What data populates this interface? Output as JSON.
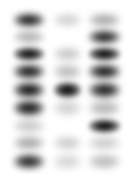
{
  "figure": {
    "background_color": "#ffffff",
    "band_color": "#000000",
    "width": 132,
    "height": 174,
    "lane_count": 3,
    "row_count": 9
  },
  "lanes": [
    {
      "name": "lane-1",
      "x": 14,
      "width": 30
    },
    {
      "name": "lane-2",
      "x": 54,
      "width": 27
    },
    {
      "name": "lane-3",
      "x": 89,
      "width": 31
    }
  ],
  "rows": [
    {
      "name": "row-1",
      "y": 13,
      "height": 14
    },
    {
      "name": "row-2",
      "y": 30,
      "height": 14
    },
    {
      "name": "row-3",
      "y": 47,
      "height": 14
    },
    {
      "name": "row-4",
      "y": 64,
      "height": 15
    },
    {
      "name": "row-5",
      "y": 82,
      "height": 16
    },
    {
      "name": "row-6",
      "y": 100,
      "height": 16
    },
    {
      "name": "row-7",
      "y": 119,
      "height": 14
    },
    {
      "name": "row-8",
      "y": 136,
      "height": 14
    },
    {
      "name": "row-9",
      "y": 154,
      "height": 15
    }
  ],
  "bands": [
    {
      "lane": 0,
      "row": 0,
      "intensity": 0.92,
      "blur": 3.0
    },
    {
      "lane": 0,
      "row": 1,
      "intensity": 0.3,
      "blur": 3.4
    },
    {
      "lane": 0,
      "row": 2,
      "intensity": 0.95,
      "blur": 2.8
    },
    {
      "lane": 0,
      "row": 3,
      "intensity": 0.93,
      "blur": 3.0
    },
    {
      "lane": 0,
      "row": 4,
      "intensity": 0.96,
      "blur": 3.0
    },
    {
      "lane": 0,
      "row": 5,
      "intensity": 0.94,
      "blur": 3.2
    },
    {
      "lane": 0,
      "row": 6,
      "intensity": 0.22,
      "blur": 3.6
    },
    {
      "lane": 0,
      "row": 7,
      "intensity": 0.34,
      "blur": 3.4
    },
    {
      "lane": 0,
      "row": 8,
      "intensity": 0.88,
      "blur": 3.0
    },
    {
      "lane": 1,
      "row": 0,
      "intensity": 0.17,
      "blur": 3.4
    },
    {
      "lane": 1,
      "row": 1,
      "intensity": 0.03,
      "blur": 3.6
    },
    {
      "lane": 1,
      "row": 2,
      "intensity": 0.21,
      "blur": 3.4
    },
    {
      "lane": 1,
      "row": 3,
      "intensity": 0.26,
      "blur": 3.2
    },
    {
      "lane": 1,
      "row": 4,
      "intensity": 0.97,
      "blur": 2.8
    },
    {
      "lane": 1,
      "row": 5,
      "intensity": 0.18,
      "blur": 3.6
    },
    {
      "lane": 1,
      "row": 6,
      "intensity": 0.04,
      "blur": 3.8
    },
    {
      "lane": 1,
      "row": 7,
      "intensity": 0.19,
      "blur": 3.4
    },
    {
      "lane": 1,
      "row": 8,
      "intensity": 0.16,
      "blur": 3.6
    },
    {
      "lane": 2,
      "row": 0,
      "intensity": 0.33,
      "blur": 3.2
    },
    {
      "lane": 2,
      "row": 1,
      "intensity": 0.9,
      "blur": 3.0
    },
    {
      "lane": 2,
      "row": 2,
      "intensity": 0.96,
      "blur": 2.8
    },
    {
      "lane": 2,
      "row": 3,
      "intensity": 0.93,
      "blur": 3.0
    },
    {
      "lane": 2,
      "row": 4,
      "intensity": 0.91,
      "blur": 3.0
    },
    {
      "lane": 2,
      "row": 5,
      "intensity": 0.28,
      "blur": 3.4
    },
    {
      "lane": 2,
      "row": 6,
      "intensity": 0.97,
      "blur": 2.8
    },
    {
      "lane": 2,
      "row": 7,
      "intensity": 0.2,
      "blur": 3.6
    },
    {
      "lane": 2,
      "row": 8,
      "intensity": 0.26,
      "blur": 3.4
    }
  ]
}
